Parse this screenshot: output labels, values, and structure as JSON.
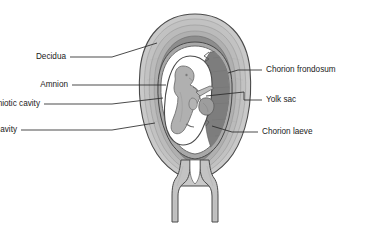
{
  "diagram": {
    "view": "mid-sagittal cross-section",
    "labels_left": [
      {
        "id": "decidua",
        "text": "Decidua",
        "text_x": 66,
        "text_y": 52,
        "leader": [
          [
            70,
            57
          ],
          [
            112,
            57
          ],
          [
            157,
            43
          ]
        ]
      },
      {
        "id": "amnion",
        "text": "Amnion",
        "text_x": 68,
        "text_y": 80,
        "leader": [
          [
            72,
            85
          ],
          [
            112,
            85
          ],
          [
            166,
            85
          ]
        ]
      },
      {
        "id": "amniotic-cavity",
        "text": "Amniotic cavity",
        "text_x": 40,
        "text_y": 99,
        "leader": [
          [
            44,
            104
          ],
          [
            112,
            104
          ],
          [
            163,
            98
          ]
        ]
      },
      {
        "id": "extra-amniotic-cavity",
        "text": "Extra amniotic cavity",
        "text_x": 17,
        "text_y": 125,
        "leader": [
          [
            21,
            130
          ],
          [
            112,
            130
          ],
          [
            155,
            123
          ]
        ]
      }
    ],
    "labels_right": [
      {
        "id": "chorion-frondosum",
        "text": "Chorion frondosum",
        "text_x": 266,
        "text_y": 65,
        "leader": [
          [
            262,
            70
          ],
          [
            238,
            70
          ],
          [
            228,
            73
          ]
        ]
      },
      {
        "id": "yolk-sac",
        "text": "Yolk sac",
        "text_x": 266,
        "text_y": 95,
        "leader": [
          [
            262,
            100
          ],
          [
            244,
            100
          ],
          [
            244,
            92
          ],
          [
            206,
            96
          ]
        ]
      },
      {
        "id": "chorion-laeve",
        "text": "Chorion laeve",
        "text_x": 262,
        "text_y": 127,
        "leader": [
          [
            258,
            132
          ],
          [
            232,
            132
          ],
          [
            212,
            126
          ]
        ]
      }
    ],
    "colors": {
      "outline": "#4a4a4a",
      "decidua_outer": "#c9c9c9",
      "decidua_mid": "#b3b3b3",
      "decidua_inner": "#9a9a9a",
      "myometrium_band": "#8a8a8a",
      "cavity_white": "#ffffff",
      "chorion_frondosum": "#7e7e7e",
      "chorion_laeve": "#a8a8a8",
      "embryo": "#b0b0b0",
      "yolk_sac": "#9d9d9d",
      "text": "#1a1a1a",
      "leader": "#2b2b2b",
      "background": "#ffffff"
    },
    "structures": [
      {
        "name": "decidua",
        "description": "outermost layered uterine wall, light grey shading"
      },
      {
        "name": "amnion",
        "description": "thin inner membrane enclosing the amniotic cavity"
      },
      {
        "name": "amniotic-cavity",
        "description": "white space around the embryo inside the amnion"
      },
      {
        "name": "extra-amniotic-cavity",
        "description": "white space between amnion and chorion"
      },
      {
        "name": "chorion-frondosum",
        "description": "dark grey thickened villous chorion on the right, jagged villi edge"
      },
      {
        "name": "chorion-laeve",
        "description": "smooth thin chorion on the lower right"
      },
      {
        "name": "yolk-sac",
        "description": "small grey sac attached to embryo by a stalk"
      },
      {
        "name": "embryo",
        "description": "grey curved fetus with head and limb buds"
      },
      {
        "name": "cervical-canal",
        "description": "narrow channel at the base of the uterus"
      },
      {
        "name": "vaginal-wall",
        "description": "paired vertical walls below the cervix"
      }
    ]
  }
}
